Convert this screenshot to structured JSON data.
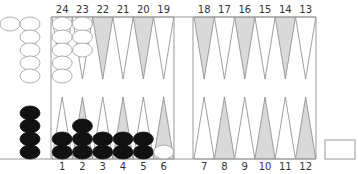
{
  "board": {
    "colors": {
      "background": "#ffffff",
      "frame": "#999999",
      "point_light": "#ffffff",
      "point_dark": "#d9d9d9",
      "point_stroke": "#888888",
      "checker_white": "#ffffff",
      "checker_white_stroke": "#999999",
      "checker_black": "#111111",
      "label": "#333333"
    },
    "top_labels": [
      "24",
      "23",
      "22",
      "21",
      "20",
      "19",
      "18",
      "17",
      "16",
      "15",
      "14",
      "13"
    ],
    "bottom_labels": [
      "1",
      "2",
      "3",
      "4",
      "5",
      "6",
      "7",
      "8",
      "9",
      "10",
      "11",
      "12"
    ],
    "top_point_shading": [
      "light",
      "light",
      "dark",
      "light",
      "dark",
      "light",
      "dark",
      "light",
      "dark",
      "light",
      "dark",
      "light"
    ],
    "bottom_point_shading": [
      "light",
      "dark",
      "light",
      "dark",
      "light",
      "dark",
      "light",
      "dark",
      "light",
      "dark",
      "light",
      "dark"
    ],
    "checkers": [
      {
        "point": 24,
        "color": "white",
        "count": 5
      },
      {
        "point": 23,
        "color": "white",
        "count": 3
      },
      {
        "point": 1,
        "color": "black",
        "count": 2
      },
      {
        "point": 2,
        "color": "black",
        "count": 3
      },
      {
        "point": 3,
        "color": "black",
        "count": 2
      },
      {
        "point": 4,
        "color": "black",
        "count": 2
      },
      {
        "point": 5,
        "color": "black",
        "count": 2
      },
      {
        "point": 6,
        "color": "white",
        "count": 1
      }
    ],
    "borne_off": {
      "white": 6,
      "black": 4
    },
    "cube_box": {
      "label": ""
    }
  }
}
